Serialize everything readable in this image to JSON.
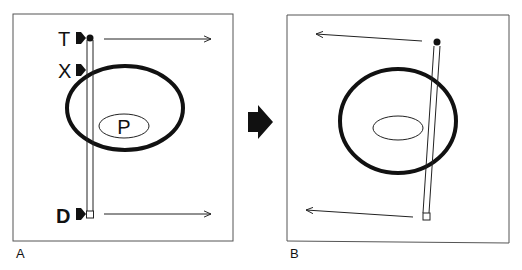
{
  "panels": [
    {
      "id": "A",
      "label": "A",
      "markers": [
        {
          "letter": "T",
          "meaning": "top marker"
        },
        {
          "letter": "X",
          "meaning": "cross marker"
        },
        {
          "letter": "D",
          "meaning": "bottom marker"
        }
      ],
      "inner_label": "P",
      "arrow_direction": "right"
    },
    {
      "id": "B",
      "label": "B",
      "arrow_direction": "left"
    }
  ],
  "transition_arrow": "right",
  "colors": {
    "stroke": "#111111",
    "frame": "#555555",
    "background": "#ffffff"
  }
}
